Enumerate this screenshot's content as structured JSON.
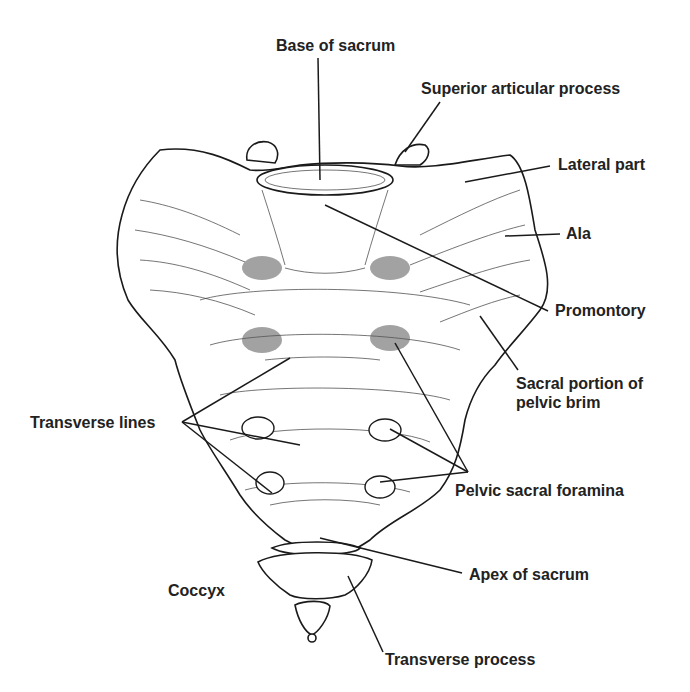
{
  "figure": {
    "labels": {
      "base_of_sacrum": "Base of sacrum",
      "superior_articular_process": "Superior articular process",
      "lateral_part": "Lateral part",
      "ala": "Ala",
      "promontory": "Promontory",
      "sacral_portion_line1": "Sacral portion of",
      "sacral_portion_line2": "pelvic brim",
      "transverse_lines": "Transverse lines",
      "pelvic_sacral_foramina": "Pelvic sacral foramina",
      "apex_of_sacrum": "Apex of sacrum",
      "coccyx": "Coccyx",
      "transverse_process": "Transverse process"
    },
    "colors": {
      "ink": "#1a1a1a",
      "label": "#222222",
      "background": "#ffffff"
    }
  }
}
